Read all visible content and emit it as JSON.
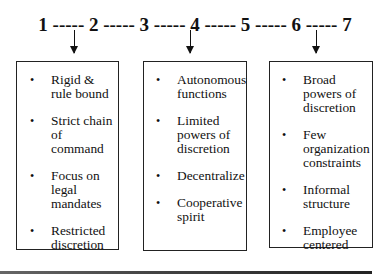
{
  "scale": {
    "label": "1 ----- 2 ----- 3 ----- 4 ----- 5 ----- 6 ----- 7",
    "points": [
      "1",
      "2",
      "3",
      "4",
      "5",
      "6",
      "7"
    ],
    "arrows_at": [
      "1",
      "4",
      "7"
    ]
  },
  "boxes": [
    {
      "points_to": "1",
      "items": [
        "Rigid & rule bound",
        "Strict chain of command",
        "Focus on legal mandates",
        "Restricted discretion"
      ]
    },
    {
      "points_to": "4",
      "items": [
        "Autonomous functions",
        "Limited powers of discretion",
        "Decentralize",
        "Cooperative spirit"
      ]
    },
    {
      "points_to": "7",
      "items": [
        "Broad powers of discretion",
        "Few organization constraints",
        "Informal structure",
        "Employee centered"
      ]
    }
  ],
  "bullet": "•"
}
